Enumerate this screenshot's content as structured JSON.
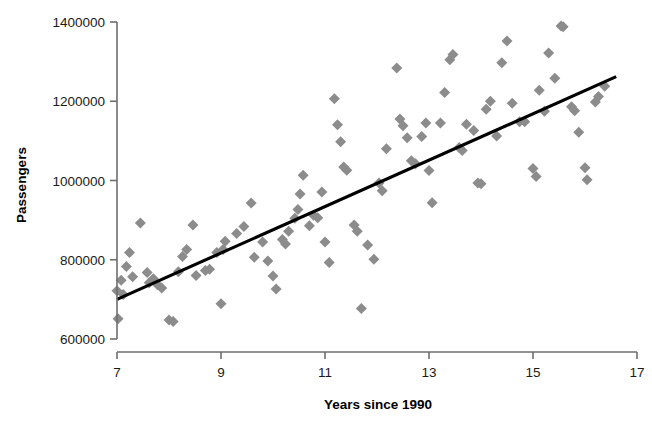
{
  "chart_data": {
    "type": "scatter",
    "title": "",
    "xlabel": "Years since 1990",
    "ylabel": "Passengers",
    "xlim": [
      7,
      17
    ],
    "ylim": [
      600000,
      1400000
    ],
    "xticks": [
      7,
      9,
      11,
      13,
      15,
      17
    ],
    "xtick_labels": [
      "7",
      "9",
      "11",
      "13",
      "15",
      "17"
    ],
    "yticks": [
      600000,
      800000,
      1000000,
      1200000,
      1400000
    ],
    "ytick_labels": [
      "600000",
      "800000",
      "1000000",
      "1200000",
      "1400000"
    ],
    "grid": false,
    "legend": null,
    "marker": {
      "shape": "diamond",
      "color": "#8c8c8c",
      "size": 11
    },
    "trendline": {
      "type": "linear",
      "color": "#000000",
      "width": 3.1,
      "x_start": 7.0,
      "y_start": 700000,
      "x_end": 16.6,
      "y_end": 1262000,
      "slope": 58542,
      "intercept": 290206
    },
    "series": [
      {
        "name": "Passengers",
        "points": [
          [
            7.0,
            722000
          ],
          [
            7.02,
            651000
          ],
          [
            7.08,
            748000
          ],
          [
            7.12,
            712000
          ],
          [
            7.18,
            783000
          ],
          [
            7.24,
            818000
          ],
          [
            7.3,
            757000
          ],
          [
            7.45,
            893000
          ],
          [
            7.58,
            768000
          ],
          [
            7.62,
            742000
          ],
          [
            7.7,
            752000
          ],
          [
            7.78,
            737000
          ],
          [
            7.86,
            729000
          ],
          [
            8.0,
            648000
          ],
          [
            8.08,
            644000
          ],
          [
            8.18,
            770000
          ],
          [
            8.26,
            808000
          ],
          [
            8.34,
            826000
          ],
          [
            8.46,
            888000
          ],
          [
            8.52,
            760000
          ],
          [
            8.7,
            773000
          ],
          [
            8.78,
            776000
          ],
          [
            8.92,
            818000
          ],
          [
            9.0,
            689000
          ],
          [
            9.04,
            826000
          ],
          [
            9.08,
            847000
          ],
          [
            9.3,
            866000
          ],
          [
            9.44,
            884000
          ],
          [
            9.58,
            943000
          ],
          [
            9.64,
            806000
          ],
          [
            9.8,
            845000
          ],
          [
            9.9,
            797000
          ],
          [
            10.0,
            759000
          ],
          [
            10.06,
            726000
          ],
          [
            10.18,
            851000
          ],
          [
            10.24,
            840000
          ],
          [
            10.3,
            872000
          ],
          [
            10.42,
            905000
          ],
          [
            10.48,
            927000
          ],
          [
            10.52,
            966000
          ],
          [
            10.58,
            1013000
          ],
          [
            10.7,
            886000
          ],
          [
            10.78,
            912000
          ],
          [
            10.86,
            906000
          ],
          [
            10.94,
            971000
          ],
          [
            11.0,
            845000
          ],
          [
            11.08,
            793000
          ],
          [
            11.18,
            1206000
          ],
          [
            11.24,
            1141000
          ],
          [
            11.3,
            1098000
          ],
          [
            11.36,
            1034000
          ],
          [
            11.42,
            1026000
          ],
          [
            11.56,
            888000
          ],
          [
            11.62,
            872000
          ],
          [
            11.7,
            677000
          ],
          [
            11.82,
            837000
          ],
          [
            11.94,
            801000
          ],
          [
            12.04,
            994000
          ],
          [
            12.1,
            974000
          ],
          [
            12.18,
            1080000
          ],
          [
            12.38,
            1284000
          ],
          [
            12.44,
            1155000
          ],
          [
            12.5,
            1138000
          ],
          [
            12.58,
            1108000
          ],
          [
            12.66,
            1050000
          ],
          [
            12.74,
            1042000
          ],
          [
            12.86,
            1111000
          ],
          [
            12.94,
            1145000
          ],
          [
            13.0,
            1025000
          ],
          [
            13.06,
            944000
          ],
          [
            13.22,
            1145000
          ],
          [
            13.3,
            1222000
          ],
          [
            13.4,
            1305000
          ],
          [
            13.46,
            1318000
          ],
          [
            13.58,
            1083000
          ],
          [
            13.64,
            1076000
          ],
          [
            13.72,
            1142000
          ],
          [
            13.86,
            1126000
          ],
          [
            13.94,
            994000
          ],
          [
            14.0,
            992000
          ],
          [
            14.1,
            1180000
          ],
          [
            14.18,
            1200000
          ],
          [
            14.3,
            1112000
          ],
          [
            14.4,
            1297000
          ],
          [
            14.5,
            1352000
          ],
          [
            14.6,
            1195000
          ],
          [
            14.74,
            1148000
          ],
          [
            14.84,
            1148000
          ],
          [
            15.0,
            1030000
          ],
          [
            15.06,
            1010000
          ],
          [
            15.12,
            1228000
          ],
          [
            15.22,
            1175000
          ],
          [
            15.3,
            1322000
          ],
          [
            15.42,
            1258000
          ],
          [
            15.54,
            1390000
          ],
          [
            15.58,
            1388000
          ],
          [
            15.74,
            1186000
          ],
          [
            15.8,
            1176000
          ],
          [
            15.88,
            1122000
          ],
          [
            16.0,
            1032000
          ],
          [
            16.04,
            1002000
          ],
          [
            16.2,
            1198000
          ],
          [
            16.26,
            1212000
          ],
          [
            16.38,
            1238000
          ]
        ]
      }
    ]
  },
  "axes": {
    "y_title": "Passengers",
    "x_title": "Years since 1990"
  }
}
